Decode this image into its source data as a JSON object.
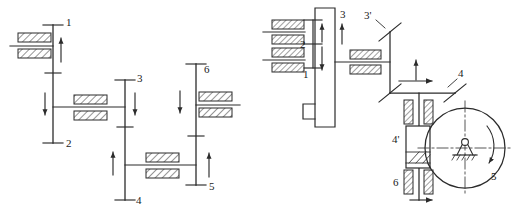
{
  "document": {
    "kind": "mechanical-kinematic-diagram",
    "title": "",
    "background_color": "#ffffff",
    "line_color": "#2b2b2b",
    "hatch_color": "#2b2b2b"
  },
  "figures": [
    {
      "id": "left-figure",
      "name": "parallel-shaft-gear-train",
      "description": "Six-position parallel shaft spur gear train schematic",
      "shafts": [
        {
          "name": "shaft-1-2",
          "labels": [
            "1",
            "2"
          ]
        },
        {
          "name": "shaft-3-4",
          "labels": [
            "3",
            "4"
          ]
        },
        {
          "name": "shaft-5-6",
          "labels": [
            "6",
            "5"
          ]
        }
      ],
      "labels": [
        {
          "id": "l1",
          "text": "1",
          "x": 66,
          "y": 26
        },
        {
          "id": "l2",
          "text": "2",
          "x": 66,
          "y": 145
        },
        {
          "id": "l3",
          "text": "3",
          "x": 136,
          "y": 82
        },
        {
          "id": "l4",
          "text": "4",
          "x": 135,
          "y": 203
        },
        {
          "id": "l5",
          "text": "5",
          "x": 207,
          "y": 196
        },
        {
          "id": "l6",
          "text": "6",
          "x": 207,
          "y": 70
        }
      ],
      "gear_meshes": [
        {
          "name": "mesh-1",
          "between": [
            "1",
            "input"
          ]
        },
        {
          "name": "mesh-2",
          "between": [
            "2",
            "3"
          ]
        },
        {
          "name": "mesh-3",
          "between": [
            "4",
            "5"
          ]
        },
        {
          "name": "mesh-4",
          "between": [
            "6",
            "output"
          ]
        }
      ]
    },
    {
      "id": "right-figure",
      "name": "sliding-block-bevel-friction-drive",
      "description": "Sliding gear block, bevel gear pair and friction wheel variable drive",
      "labels": [
        {
          "id": "r1",
          "text": "1",
          "x": 311,
          "y": 69
        },
        {
          "id": "r2",
          "text": "2",
          "x": 302,
          "y": 45
        },
        {
          "id": "r3",
          "text": "3",
          "x": 339,
          "y": 15
        },
        {
          "id": "r3p",
          "text": "3'",
          "x": 375,
          "y": 24
        },
        {
          "id": "r4",
          "text": "4",
          "x": 456,
          "y": 73
        },
        {
          "id": "r4p",
          "text": "4'",
          "x": 391,
          "y": 138
        },
        {
          "id": "r5",
          "text": "5",
          "x": 495,
          "y": 180
        },
        {
          "id": "r6",
          "text": "6",
          "x": 392,
          "y": 185
        }
      ],
      "components": [
        {
          "name": "sliding-gear-block",
          "type": "slider"
        },
        {
          "name": "bevel-gear-pair",
          "type": "bevel"
        },
        {
          "name": "friction-roller",
          "type": "block"
        },
        {
          "name": "friction-disc",
          "type": "disc"
        },
        {
          "name": "fixed-pivot-support",
          "type": "ground-pivot"
        },
        {
          "name": "rotation-arrow",
          "type": "curved-arrow"
        }
      ]
    }
  ]
}
